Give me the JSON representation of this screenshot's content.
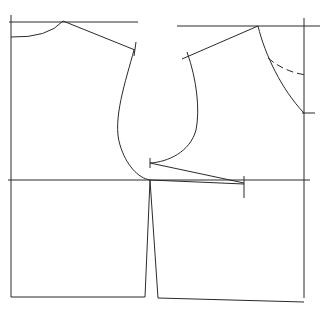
{
  "diagram": {
    "colors": {
      "line": "#2a2a2a",
      "background": "#ffffff"
    },
    "pieces": [
      {
        "name": "back-bodice",
        "features": [
          "neckline",
          "shoulder-line",
          "armhole",
          "waistline",
          "side-seam"
        ]
      },
      {
        "name": "front-bodice",
        "features": [
          "neckline",
          "dashed-neckline-alternative",
          "shoulder-line",
          "armhole",
          "bust-dart",
          "waistline"
        ]
      }
    ],
    "labels": []
  }
}
